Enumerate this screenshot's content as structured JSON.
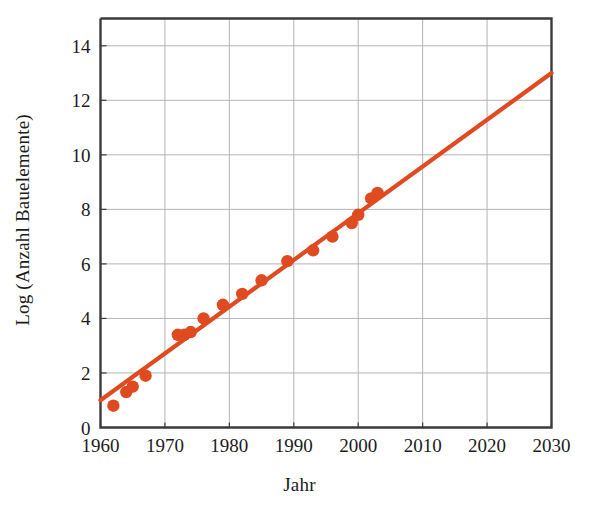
{
  "chart_data": {
    "type": "scatter",
    "title": "",
    "xlabel": "Jahr",
    "ylabel": "Log (Anzahl Bauelemente)",
    "xlim": [
      1960,
      2030
    ],
    "ylim": [
      0,
      15
    ],
    "xticks": [
      1960,
      1970,
      1980,
      1990,
      2000,
      2010,
      2020,
      2030
    ],
    "xticklabels": [
      "1960",
      "1970",
      "1980",
      "1990",
      "2000",
      "2010",
      "2020",
      "2030"
    ],
    "yticks": [
      0,
      2,
      4,
      6,
      8,
      10,
      12,
      14
    ],
    "yticklabels": [
      "0",
      "2",
      "4",
      "6",
      "8",
      "10",
      "12",
      "14"
    ],
    "grid": true,
    "legend": false,
    "series": [
      {
        "name": "Bauelemente pro Chip (gemessen)",
        "type": "scatter",
        "marker": "circle",
        "color": "#E04A20",
        "points": [
          {
            "x": 1962,
            "y": 0.8
          },
          {
            "x": 1964,
            "y": 1.3
          },
          {
            "x": 1965,
            "y": 1.5
          },
          {
            "x": 1967,
            "y": 1.9
          },
          {
            "x": 1972,
            "y": 3.4
          },
          {
            "x": 1973,
            "y": 3.4
          },
          {
            "x": 1974,
            "y": 3.5
          },
          {
            "x": 1976,
            "y": 4.0
          },
          {
            "x": 1979,
            "y": 4.5
          },
          {
            "x": 1982,
            "y": 4.9
          },
          {
            "x": 1985,
            "y": 5.4
          },
          {
            "x": 1989,
            "y": 6.1
          },
          {
            "x": 1993,
            "y": 6.5
          },
          {
            "x": 1996,
            "y": 7.0
          },
          {
            "x": 1999,
            "y": 7.5
          },
          {
            "x": 2000,
            "y": 7.8
          },
          {
            "x": 2002,
            "y": 8.4
          },
          {
            "x": 2003,
            "y": 8.6
          }
        ]
      },
      {
        "name": "Trendlinie (Moore'sches Gesetz)",
        "type": "line",
        "color": "#E04A20",
        "points": [
          {
            "x": 1960,
            "y": 1.0
          },
          {
            "x": 2030,
            "y": 13.0
          }
        ]
      }
    ],
    "colors": {
      "data": "#E04A20",
      "trendline": "#E04A20",
      "grid": "#b4b4b4",
      "axis": "#3b3b3b",
      "text": "#1c1c1c",
      "background": "#ffffff"
    }
  }
}
